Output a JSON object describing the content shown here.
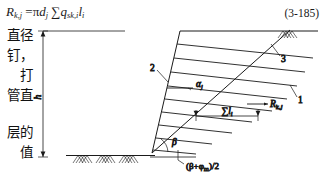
{
  "equation": {
    "lhs": "R",
    "lhs_sub": "k,j",
    "rhs_pi": "π",
    "rhs_d": "d",
    "rhs_d_sub": "j",
    "sigma": "∑",
    "q": "q",
    "q_sub": "sk,i",
    "l": "l",
    "l_sub": "i",
    "equals": "=",
    "number": "(3-185)",
    "plain_text": "R(k,j) = πd(j) ∑q(sk,i) l(i)"
  },
  "body_text_column": {
    "lines": [
      "直径",
      "钉，",
      "打",
      "管直",
      "层的",
      "值"
    ]
  },
  "figure": {
    "name": "soil-nail-wall-diagram",
    "dimension_label": "h",
    "annotations": {
      "alpha": "α",
      "alpha_sub": "j",
      "beta": "β",
      "sum_l": "∑l",
      "sum_l_sub": "i",
      "force": "R",
      "force_sub": "k,j",
      "slip_angle": "(β+φ",
      "slip_angle_sub": "m",
      "slip_angle_tail": ")/2"
    },
    "callouts": [
      {
        "id": "1",
        "label": "1"
      },
      {
        "id": "2",
        "label": "2"
      },
      {
        "id": "3",
        "label": "3"
      }
    ],
    "colors": {
      "line": "#1a1a1a",
      "ground": "#333333",
      "background": "#ffffff"
    }
  }
}
